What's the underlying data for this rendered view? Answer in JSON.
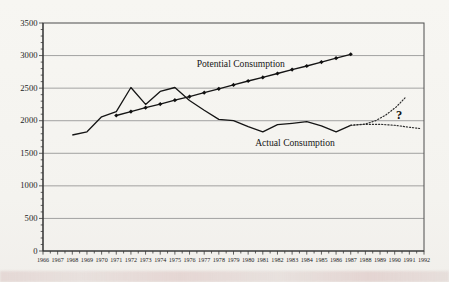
{
  "figure": {
    "background": "#f6f5f1",
    "line_color": "#151515",
    "grid_color": "#8d8d8d"
  },
  "chart_data": {
    "type": "line",
    "title": "",
    "xlabel": "",
    "ylabel": "",
    "xlim": [
      1966,
      1992
    ],
    "ylim": [
      0,
      3500
    ],
    "grid": "horizontal",
    "legend_position": "none",
    "y_ticks": [
      0,
      500,
      1000,
      1500,
      2000,
      2500,
      3000,
      3500
    ],
    "x_ticks": [
      1966,
      1967,
      1968,
      1969,
      1970,
      1971,
      1972,
      1973,
      1974,
      1975,
      1976,
      1977,
      1978,
      1979,
      1980,
      1981,
      1982,
      1983,
      1984,
      1985,
      1986,
      1987,
      1988,
      1989,
      1990,
      1991,
      1992
    ],
    "series": [
      {
        "name": "Potential Consumption",
        "style": "solid-markers",
        "x": [
          1971,
          1972,
          1973,
          1974,
          1975,
          1976,
          1977,
          1978,
          1979,
          1980,
          1981,
          1982,
          1983,
          1984,
          1985,
          1986,
          1987
        ],
        "values": [
          2080,
          2140,
          2200,
          2255,
          2315,
          2370,
          2430,
          2490,
          2550,
          2610,
          2665,
          2725,
          2785,
          2840,
          2900,
          2960,
          3020
        ]
      },
      {
        "name": "Actual Consumption",
        "style": "solid",
        "x": [
          1968,
          1969,
          1970,
          1971,
          1972,
          1973,
          1974,
          1975,
          1976,
          1977,
          1978,
          1979,
          1980,
          1981,
          1982,
          1983,
          1984,
          1985,
          1986,
          1987
        ],
        "values": [
          1780,
          1830,
          2060,
          2140,
          2510,
          2250,
          2450,
          2510,
          2310,
          2160,
          2020,
          2000,
          1910,
          1830,
          1940,
          1960,
          1985,
          1920,
          1830,
          1930
        ]
      },
      {
        "name": "Projection (high)",
        "style": "dotted",
        "x": [
          1987,
          1988,
          1988.7,
          1989.4,
          1990.1,
          1990.7
        ],
        "values": [
          1930,
          1950,
          2000,
          2090,
          2210,
          2350
        ]
      },
      {
        "name": "Projection (low)",
        "style": "dotted",
        "x": [
          1987,
          1988,
          1989,
          1990,
          1991,
          1991.7
        ],
        "values": [
          1930,
          1945,
          1945,
          1930,
          1900,
          1880
        ]
      }
    ],
    "labels": [
      {
        "text": "Potential Consumption",
        "x": 1979.5,
        "y": 2865
      },
      {
        "text": "Actual Consumption",
        "x": 1983.2,
        "y": 1658
      }
    ],
    "annotations": [
      {
        "text": "?",
        "x": 1990.3,
        "y": 2090
      }
    ]
  }
}
